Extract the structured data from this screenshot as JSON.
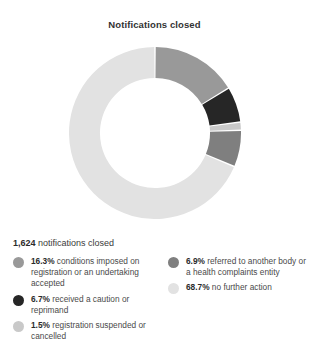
{
  "chart_data": {
    "type": "pie",
    "title": "Notifications closed",
    "subtitle": "",
    "xlabel": "",
    "ylabel": "",
    "donut": true,
    "inner_radius_ratio": 0.64,
    "start_angle_deg": 0,
    "direction": "clockwise",
    "total_label": "1,624 notifications closed",
    "total_count": "1,624",
    "total_suffix": "notifications closed",
    "legend_position": "bottom",
    "grid": false,
    "categories": [
      "conditions imposed on registration or an undertaking accepted",
      "received a caution or reprimand",
      "registration suspended or cancelled",
      "referred to another body or retained by a health complaints entity",
      "no further action"
    ],
    "values": [
      16.3,
      6.7,
      1.5,
      6.9,
      68.7
    ],
    "value_labels": [
      "16.3%",
      "6.7%",
      "1.5%",
      "6.9%",
      "68.7%"
    ],
    "colors": [
      "#999999",
      "#262626",
      "#c9c9c9",
      "#7f7f7f",
      "#e2e2e2"
    ],
    "units": "percent"
  },
  "title": "Notifications closed",
  "summary": {
    "count": "1,624",
    "suffix": "notifications closed"
  },
  "legend": {
    "left": [
      {
        "pct": "16.3%",
        "label": "conditions imposed on registration or an undertaking accepted",
        "color": "#999999"
      },
      {
        "pct": "6.7%",
        "label": "received a caution or reprimand",
        "color": "#262626"
      },
      {
        "pct": "1.5%",
        "label": "registration suspended or cancelled",
        "color": "#c9c9c9"
      }
    ],
    "right": [
      {
        "pct": "6.9%",
        "label": "referred to another body or a health complaints entity",
        "color": "#7f7f7f"
      },
      {
        "pct": "68.7%",
        "label": "no further action",
        "color": "#e2e2e2"
      }
    ]
  }
}
